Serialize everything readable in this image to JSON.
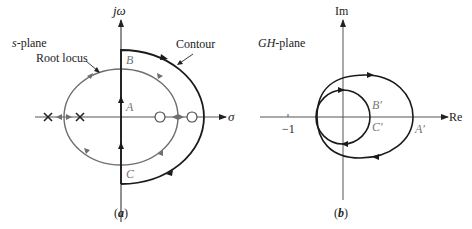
{
  "panel_a": {
    "caption": "(a)",
    "caption_letter": "a",
    "plane_label": "s-plane",
    "plane_label_var": "s",
    "plane_label_rest": "-plane",
    "imag_axis_label": "jω",
    "real_axis_label": "σ",
    "root_locus_label": "Root locus",
    "contour_label": "Contour",
    "points": {
      "A": "A",
      "B": "B",
      "C": "C"
    },
    "poles_count": 2,
    "zeros_count": 2,
    "colors": {
      "axis": "#222222",
      "contour": "#1a1a1a",
      "root_locus": "#6e6e6e",
      "labels_gray": "#777777"
    }
  },
  "panel_b": {
    "caption": "(b)",
    "caption_letter": "b",
    "plane_label": "GH-plane",
    "plane_label_var": "GH",
    "plane_label_rest": "-plane",
    "imag_axis_label": "Im",
    "real_axis_label": "Re",
    "tick_label": "−1",
    "points": {
      "A": "A′",
      "B": "B′",
      "C": "C′"
    },
    "colors": {
      "axis": "#222222",
      "curve": "#1a1a1a",
      "labels_gray": "#777777"
    }
  }
}
